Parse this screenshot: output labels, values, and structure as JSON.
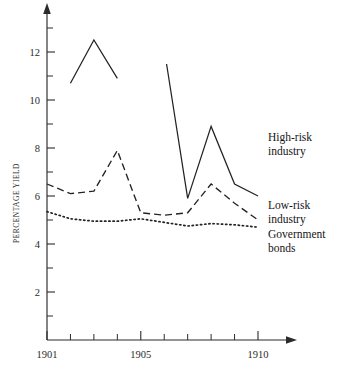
{
  "chart_data": {
    "type": "line",
    "title": "",
    "xlabel": "",
    "ylabel": "PERCENTAGE YIELD",
    "xlim": [
      1901,
      1910
    ],
    "ylim": [
      0,
      13.2
    ],
    "grid": false,
    "legend_position": "right-inline-labels",
    "x_ticks": [
      1901,
      1902,
      1903,
      1904,
      1905,
      1906,
      1907,
      1908,
      1909,
      1910
    ],
    "x_tick_labels": [
      "1901",
      "",
      "",
      "",
      "1905",
      "",
      "",
      "",
      "",
      "1910"
    ],
    "y_ticks": [
      2,
      4,
      6,
      8,
      10,
      12
    ],
    "y_tick_labels": [
      "2",
      "4",
      "6",
      "8",
      "10",
      "12"
    ],
    "y_minor_ticks": [
      1,
      3,
      5,
      7,
      9,
      11,
      13
    ],
    "series": [
      {
        "name": "High-risk industry",
        "label": "High-risk",
        "label_line2": "industry",
        "style": "solid",
        "has_gap": true,
        "x": [
          1902,
          1903,
          1904,
          1906.1,
          1907,
          1908,
          1909,
          1910
        ],
        "values": [
          10.7,
          12.5,
          10.9,
          11.5,
          5.9,
          8.9,
          6.5,
          6.0
        ],
        "segments": [
          {
            "x": [
              1902,
              1903,
              1904
            ],
            "values": [
              10.7,
              12.5,
              10.9
            ]
          },
          {
            "x": [
              1906.1,
              1907,
              1908,
              1909,
              1910
            ],
            "values": [
              11.5,
              5.9,
              8.9,
              6.5,
              6.0
            ]
          }
        ]
      },
      {
        "name": "Low-risk industry",
        "label": "Low-risk",
        "label_line2": "industry",
        "style": "dashed",
        "has_gap": false,
        "x": [
          1901,
          1902,
          1903,
          1904,
          1905,
          1906,
          1907,
          1908,
          1909,
          1910
        ],
        "values": [
          6.5,
          6.1,
          6.2,
          7.9,
          5.3,
          5.2,
          5.3,
          6.5,
          5.7,
          5.0
        ],
        "segments": [
          {
            "x": [
              1901,
              1902,
              1903,
              1904,
              1905,
              1906,
              1907,
              1908,
              1909,
              1910
            ],
            "values": [
              6.5,
              6.1,
              6.2,
              7.9,
              5.3,
              5.2,
              5.3,
              6.5,
              5.7,
              5.0
            ]
          }
        ]
      },
      {
        "name": "Government bonds",
        "label": "Government",
        "label_line2": "bonds",
        "style": "dotted",
        "has_gap": false,
        "x": [
          1901,
          1902,
          1903,
          1904,
          1905,
          1906,
          1907,
          1908,
          1909,
          1910
        ],
        "values": [
          5.35,
          5.05,
          4.95,
          4.95,
          5.05,
          4.9,
          4.75,
          4.85,
          4.8,
          4.7
        ],
        "segments": [
          {
            "x": [
              1901,
              1902,
              1903,
              1904,
              1905,
              1906,
              1907,
              1908,
              1909,
              1910
            ],
            "values": [
              5.35,
              5.05,
              4.95,
              4.95,
              5.05,
              4.9,
              4.75,
              4.85,
              4.8,
              4.7
            ]
          }
        ]
      }
    ],
    "colors": {
      "axis": "#2b2b2b",
      "line": "#232323",
      "text": "#1a1a1a",
      "background": "#ffffff"
    }
  }
}
